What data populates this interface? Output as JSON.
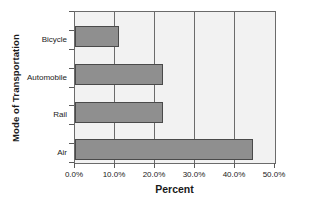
{
  "chart_data": {
    "type": "bar",
    "orientation": "horizontal",
    "title": "",
    "xlabel": "Percent",
    "ylabel": "Mode of Transportation",
    "categories": [
      "Bicycle",
      "Automobile",
      "Rail",
      "Air"
    ],
    "values": [
      11.0,
      22.0,
      22.0,
      44.5
    ],
    "xlim": [
      0,
      50
    ],
    "xticks": [
      0,
      10,
      20,
      30,
      40,
      50
    ],
    "xticklabels": [
      "0.0%",
      "10.0%",
      "20.0%",
      "30.0%",
      "40.0%",
      "50.0%"
    ],
    "grid": "vertical",
    "legend": "none",
    "series": [
      {
        "name": "Percent",
        "values": [
          11.0,
          22.0,
          22.0,
          44.5
        ]
      }
    ],
    "colors": {
      "bar_fill": "#8f8f8f",
      "bar_border": "#4a4a4a",
      "plot_background": "#f2f2f2",
      "axis": "#6b6b6b",
      "text": "#1a1a1a",
      "figure_background": "#ffffff"
    }
  }
}
